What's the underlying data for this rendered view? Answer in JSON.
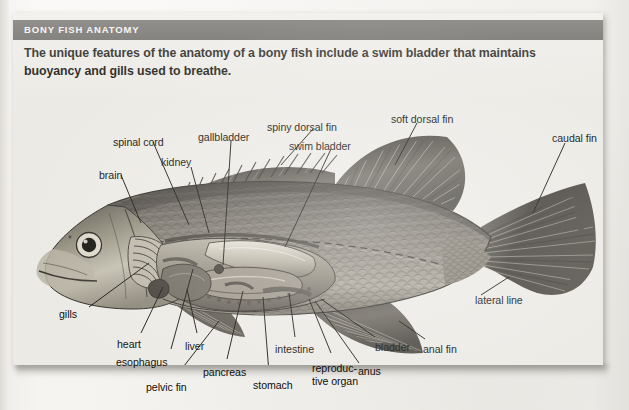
{
  "page": {
    "background_color": "#f3f1ed",
    "panel_color": "#eceae5"
  },
  "header": {
    "title": "BONY FISH ANATOMY",
    "bar_color": "#5d5b56",
    "text_color": "#f4f2ee"
  },
  "intro": {
    "text": "The unique features of the anatomy of a bony fish include a swim bladder that maintains buoyancy and gills used to breathe."
  },
  "diagram": {
    "style": "grayscale halftone print illustration",
    "labels": [
      {
        "name": "brain",
        "text": "brain",
        "x": 86,
        "y": 156,
        "anchor": "start"
      },
      {
        "name": "spinal-cord",
        "text": "spinal cord",
        "x": 100,
        "y": 123,
        "anchor": "start"
      },
      {
        "name": "kidney",
        "text": "kidney",
        "x": 148,
        "y": 143,
        "anchor": "start"
      },
      {
        "name": "gallbladder",
        "text": "gallbladder",
        "x": 185,
        "y": 118,
        "anchor": "start"
      },
      {
        "name": "spiny-dorsal-fin",
        "text": "spiny dorsal fin",
        "x": 254,
        "y": 108,
        "anchor": "start"
      },
      {
        "name": "swim-bladder",
        "text": "swim bladder",
        "x": 276,
        "y": 127,
        "anchor": "start"
      },
      {
        "name": "soft-dorsal-fin",
        "text": "soft dorsal fin",
        "x": 378,
        "y": 100,
        "anchor": "start"
      },
      {
        "name": "caudal-fin",
        "text": "caudal fin",
        "x": 539,
        "y": 119,
        "anchor": "start"
      },
      {
        "name": "lateral-line",
        "text": "lateral line",
        "x": 462,
        "y": 281,
        "anchor": "start"
      },
      {
        "name": "anal-fin",
        "text": "anal fin",
        "x": 410,
        "y": 330,
        "anchor": "start"
      },
      {
        "name": "bladder",
        "text": "bladder",
        "x": 362,
        "y": 328,
        "anchor": "start"
      },
      {
        "name": "anus",
        "text": "anus",
        "x": 345,
        "y": 352,
        "anchor": "start"
      },
      {
        "name": "reproductive-organ",
        "text": "reproduc-\ntive organ",
        "x": 299,
        "y": 349,
        "anchor": "start"
      },
      {
        "name": "intestine",
        "text": "intestine",
        "x": 262,
        "y": 330,
        "anchor": "start"
      },
      {
        "name": "stomach",
        "text": "stomach",
        "x": 240,
        "y": 366,
        "anchor": "start"
      },
      {
        "name": "pancreas",
        "text": "pancreas",
        "x": 190,
        "y": 353,
        "anchor": "start"
      },
      {
        "name": "pelvic-fin",
        "text": "pelvic fin",
        "x": 133,
        "y": 368,
        "anchor": "start"
      },
      {
        "name": "esophagus",
        "text": "esophagus",
        "x": 103,
        "y": 343,
        "anchor": "start"
      },
      {
        "name": "liver",
        "text": "liver",
        "x": 172,
        "y": 327,
        "anchor": "start"
      },
      {
        "name": "heart",
        "text": "heart",
        "x": 104,
        "y": 325,
        "anchor": "start"
      },
      {
        "name": "gills",
        "text": "gills",
        "x": 46,
        "y": 295,
        "anchor": "start"
      }
    ]
  }
}
